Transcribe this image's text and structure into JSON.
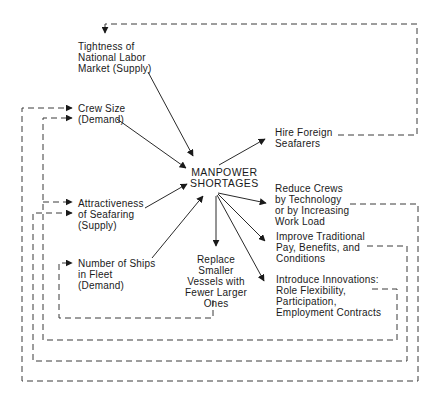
{
  "diagram": {
    "type": "causal-loop",
    "central_node": {
      "id": "manpower-shortages",
      "lines": [
        "MANPOWER",
        "SHORTAGES"
      ]
    },
    "causes": [
      {
        "id": "labor-market",
        "lines": [
          "Tightness of",
          "National Labor",
          "Market (Supply)"
        ]
      },
      {
        "id": "crew-size",
        "lines": [
          "Crew Size",
          "(Demand)"
        ]
      },
      {
        "id": "attractiveness",
        "lines": [
          "Attractiveness",
          "of Seafaring",
          "(Supply)"
        ]
      },
      {
        "id": "ships-in-fleet",
        "lines": [
          "Number of Ships",
          "in Fleet",
          "(Demand)"
        ]
      }
    ],
    "responses": [
      {
        "id": "hire-foreign",
        "lines": [
          "Hire Foreign",
          "Seafarers"
        ],
        "feeds_back_to": "labor-market"
      },
      {
        "id": "reduce-crews",
        "lines": [
          "Reduce Crews",
          "by Technology",
          "or by Increasing",
          "Work Load"
        ],
        "feeds_back_to": "crew-size"
      },
      {
        "id": "improve-pay",
        "lines": [
          "Improve Traditional",
          "Pay, Benefits, and",
          "Conditions"
        ],
        "feeds_back_to": "attractiveness"
      },
      {
        "id": "innovations",
        "lines": [
          "Introduce Innovations:",
          "Role Flexibility,",
          "Participation,",
          "Employment Contracts"
        ],
        "feeds_back_to": "crew-size"
      },
      {
        "id": "replace-vessels",
        "lines": [
          "Replace",
          "Smaller",
          "Vessels with",
          "Fewer Larger",
          "Ones"
        ],
        "feeds_back_to": "ships-in-fleet"
      }
    ],
    "edges": {
      "solid": "cause/response arrow",
      "dashed": "feedback loop"
    },
    "colors": {
      "line": "#2a2a2a",
      "text": "#1a1a1a",
      "background": "#ffffff"
    }
  }
}
